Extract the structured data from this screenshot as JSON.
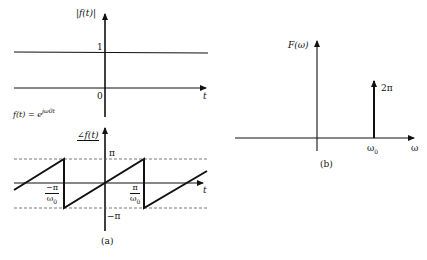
{
  "figure": {
    "panel_a_caption": "(a)",
    "panel_b_caption": "(b)"
  },
  "magnitude_plot": {
    "ylabel": "|f(t)|",
    "xlabel": "t",
    "level_label": "1",
    "origin_label": "0",
    "formula_lhs": "f(t) = e",
    "formula_exp": "jω0t"
  },
  "phase_plot": {
    "ylabel": "∠f(t)",
    "xlabel": "t",
    "upper_label": "π",
    "lower_label": "−π",
    "left_tick_num": "−π",
    "left_tick_den": "ω",
    "left_tick_den_sub": "0",
    "right_tick_num": "π",
    "right_tick_den": "ω",
    "right_tick_den_sub": "0"
  },
  "spectrum_plot": {
    "ylabel": "F(ω)",
    "xlabel": "ω",
    "impulse_label": "2π",
    "impulse_pos": "ω",
    "impulse_pos_sub": "0"
  },
  "colors": {
    "ink": "#111111",
    "background": "#ffffff",
    "dashed": "#555555"
  }
}
